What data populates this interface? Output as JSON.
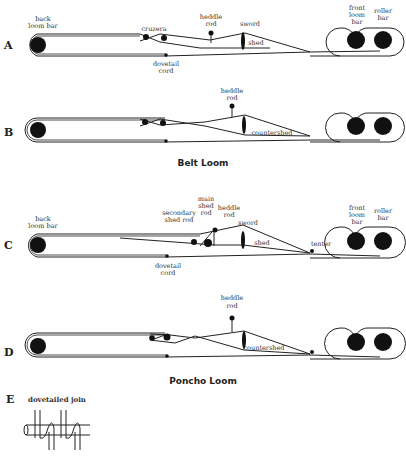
{
  "figure": {
    "panels": [
      {
        "letter": "A",
        "labels": {
          "back": "back\nloom bar",
          "cruzera": "cruzera",
          "heddle": "heddle\nrod",
          "sword": "sword",
          "shed": "shed",
          "dovetail": "dovetail\ncord",
          "front": "front\nloom\nbar",
          "roller": "roller\nbar"
        }
      },
      {
        "letter": "B",
        "labels": {
          "heddle": "heddle\nrod",
          "countershed": "countershed"
        }
      },
      {
        "letter": "C",
        "labels": {
          "back": "back\nloom bar",
          "secondary": "secondary\nshed rod",
          "main": "main\nshed\nrod",
          "heddle": "heddle\nrod",
          "sword": "sword",
          "shed": "shed",
          "tenter": "tenter",
          "dovetail": "dovetail\ncord",
          "front": "front\nloom\nbar",
          "roller": "roller\nbar"
        }
      },
      {
        "letter": "D",
        "labels": {
          "heddle": "heddle\nrod",
          "countershed": "countershed"
        }
      },
      {
        "letter": "E",
        "labels": {
          "title": "dovetailed join"
        }
      }
    ],
    "section_titles": {
      "belt": "Belt Loom",
      "poncho": "Poncho Loom"
    }
  },
  "text": {
    "A": "A",
    "B": "B",
    "C": "C",
    "D": "D",
    "E": "E",
    "back1": "back",
    "back2": "loom bar",
    "cruzera": "cruzera",
    "heddle1": "heddle",
    "heddle2": "rod",
    "sword": "sword",
    "shed": "shed",
    "dove1": "dovetail",
    "dove2": "cord",
    "front1": "front",
    "front2": "loom",
    "front3": "bar",
    "roller1": "roller",
    "roller2": "bar",
    "countershed": "countershed",
    "belt": "Belt Loom",
    "sec1": "secondary",
    "sec2": "shed rod",
    "main1": "main",
    "main2": "shed",
    "main3": "rod",
    "tenter": "tenter",
    "poncho": "Poncho Loom",
    "join": "dovetailed join"
  }
}
